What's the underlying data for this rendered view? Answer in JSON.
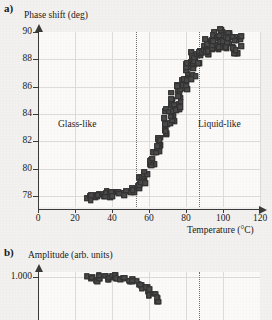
{
  "figure": {
    "panel_a_label": "a)",
    "panel_b_label": "b)"
  },
  "chart_data": [
    {
      "type": "scatter",
      "panel": "a)",
      "title": "",
      "ylabel": "Phase shift (deg)",
      "xlabel": "Temperature (°C)",
      "xlim": [
        0,
        120
      ],
      "ylim": [
        77.2,
        90
      ],
      "xticks": [
        0,
        20,
        40,
        60,
        80,
        100,
        120
      ],
      "yticks": [
        78,
        80,
        82,
        84,
        86,
        88,
        90
      ],
      "grid": true,
      "legend": "none",
      "annotations": [
        {
          "text": "Glass-like",
          "x": 28,
          "y": 83.2
        },
        {
          "text": "Liquid-like",
          "x": 97,
          "y": 83.2
        }
      ],
      "vertical_markers": [
        {
          "x": 53,
          "style": "dotted"
        },
        {
          "x": 87,
          "style": "dotted"
        }
      ],
      "x": [
        27.0,
        28.2,
        29.0,
        29.8,
        30.5,
        31.2,
        32.0,
        32.8,
        33.5,
        34.2,
        35.0,
        35.8,
        36.5,
        37.2,
        38.0,
        38.8,
        39.5,
        40.2,
        41.0,
        41.8,
        42.5,
        43.2,
        44.0,
        44.8,
        45.5,
        46.2,
        47.0,
        47.8,
        48.5,
        49.2,
        50.0,
        50.8,
        51.5,
        52.2,
        53.0,
        53.8,
        54.5,
        55.2,
        56.0,
        56.8,
        57.5,
        58.2,
        59.0,
        59.8,
        60.5,
        61.2,
        62.0,
        62.8,
        63.5,
        64.2,
        65.0,
        65.8,
        66.5,
        67.2,
        68.0,
        68.8,
        69.5,
        70.2,
        71.0,
        71.8,
        72.5,
        73.2,
        74.0,
        74.8,
        75.5,
        76.2,
        77.0,
        77.8,
        78.5,
        79.2,
        80.0,
        80.8,
        81.5,
        82.2,
        83.0,
        83.8,
        84.5,
        85.2,
        86.0,
        86.8,
        87.5,
        88.2,
        89.0,
        89.8,
        90.5,
        91.2,
        92.0,
        92.8,
        93.5,
        94.2,
        95.0,
        95.8,
        96.5,
        97.2,
        98.0,
        98.8,
        99.5,
        100.2,
        101.0,
        101.8,
        102.5,
        103.2,
        104.0,
        104.8,
        105.5,
        106.2,
        107.0,
        107.8,
        108.5,
        109.2
      ],
      "y": [
        77.9,
        77.8,
        78.0,
        77.7,
        77.9,
        78.0,
        77.8,
        78.1,
        77.9,
        78.0,
        78.0,
        77.9,
        78.2,
        78.0,
        78.1,
        77.9,
        78.0,
        78.2,
        78.1,
        78.0,
        78.2,
        78.1,
        78.3,
        78.1,
        78.2,
        78.0,
        78.3,
        78.2,
        78.1,
        78.3,
        78.2,
        78.4,
        78.3,
        78.5,
        78.4,
        78.6,
        78.5,
        78.8,
        78.6,
        79.0,
        78.9,
        79.3,
        79.2,
        79.6,
        79.4,
        80.2,
        79.9,
        80.6,
        80.4,
        81.2,
        80.9,
        81.6,
        81.3,
        82.3,
        81.9,
        82.7,
        82.4,
        83.3,
        83.0,
        83.6,
        83.4,
        84.2,
        83.9,
        84.6,
        84.4,
        85.1,
        84.8,
        85.6,
        85.3,
        86.1,
        85.9,
        86.6,
        86.3,
        87.0,
        86.8,
        87.3,
        87.1,
        87.6,
        87.4,
        87.8,
        87.7,
        88.1,
        87.9,
        88.4,
        88.2,
        88.6,
        88.3,
        88.8,
        88.5,
        89.0,
        88.7,
        89.2,
        88.9,
        89.3,
        89.0,
        89.4,
        89.1,
        89.4,
        89.2,
        89.3,
        89.0,
        89.2,
        88.9,
        89.1,
        88.8,
        89.0,
        88.7,
        88.9,
        88.5,
        88.7
      ]
    },
    {
      "type": "scatter",
      "panel": "b)",
      "title": "",
      "ylabel": "Amplitude (arb. units)",
      "xlabel": "Temperature (°C)",
      "xlim": [
        0,
        120
      ],
      "ylim": [
        0.92,
        1.01
      ],
      "xticks": [
        0,
        20,
        40,
        60,
        80,
        100,
        120
      ],
      "yticks": [
        1.0
      ],
      "grid": true,
      "legend": "none",
      "vertical_markers": [
        {
          "x": 87,
          "style": "dotted"
        }
      ],
      "x": [
        27.0,
        28.5,
        30.0,
        31.5,
        33.0,
        34.5,
        36.0,
        37.5,
        39.0,
        40.5,
        42.0,
        43.5,
        45.0,
        46.5,
        48.0,
        49.5,
        51.0,
        52.5,
        54.0,
        55.5,
        57.0,
        58.5,
        60.0,
        61.5,
        63.0,
        64.5,
        66.0
      ],
      "y": [
        1.0,
        0.996,
        0.994,
        0.995,
        0.997,
        0.998,
        0.998,
        0.997,
        0.998,
        0.997,
        0.997,
        0.996,
        0.997,
        0.996,
        0.995,
        0.994,
        0.992,
        0.99,
        0.987,
        0.984,
        0.98,
        0.976,
        0.972,
        0.968,
        0.963,
        0.958,
        0.953
      ]
    }
  ]
}
